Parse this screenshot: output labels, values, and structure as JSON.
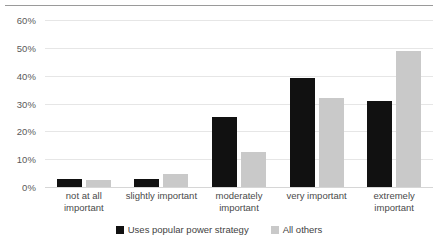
{
  "chart_data": {
    "type": "bar",
    "title": "",
    "subtitle": "",
    "xlabel": "",
    "ylabel": "",
    "categories": [
      "not at all important",
      "slightly important",
      "moderately important",
      "very important",
      "extremely important"
    ],
    "series": [
      {
        "name": "Uses popular power strategy",
        "color": "#111111",
        "values": [
          3,
          3,
          25,
          39,
          31
        ]
      },
      {
        "name": "All others",
        "color": "#c9c9c9",
        "values": [
          2.5,
          4.5,
          12.5,
          32,
          49
        ]
      }
    ],
    "ylim": [
      0,
      60
    ],
    "ytick_values": [
      0,
      10,
      20,
      30,
      40,
      50,
      60
    ],
    "ytick_labels": [
      "0%",
      "10%",
      "20%",
      "30%",
      "40%",
      "50%",
      "60%"
    ],
    "grid": true,
    "grid_axis": "y",
    "legend_position": "bottom",
    "legend_entries": [
      "Uses popular power strategy",
      "All others"
    ],
    "annotations": []
  },
  "xtick_lines": [
    [
      "not at all",
      "important"
    ],
    [
      "slightly important",
      ""
    ],
    [
      "moderately",
      "important"
    ],
    [
      "very important",
      ""
    ],
    [
      "extremely",
      "important"
    ]
  ],
  "colors": {
    "series_0": "#111111",
    "series_1": "#c9c9c9",
    "gridline": "#e6e6e6",
    "axis_text": "#5a5a5a",
    "top_rule": "#9a9a9a"
  }
}
